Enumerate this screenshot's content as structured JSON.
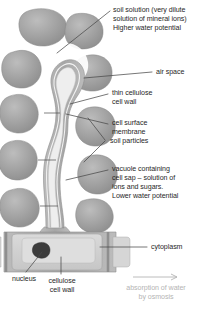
{
  "diagram": {
    "labels": {
      "soil_solution": "soil solution (very dilute\nsolution of mineral ions)\nHigher water potential",
      "air_space": "air space",
      "thin_cellulose_cell_wall": "thin cellulose\ncell wall",
      "cell_surface_membrane": "cell surface\nmembrane",
      "soil_particles": "soil particles",
      "vacuole": "vacuole containing\ncell sap – solution of\nions and sugars.\nLower water potential",
      "cytoplasm": "cytoplasm",
      "nucleus": "nucleus",
      "cellulose_cell_wall": "cellulose\ncell wall",
      "absorption_arrow_caption": "absorption of water\nby osmosis"
    },
    "colors": {
      "soil_particle": "#9b9b9b",
      "soil_particle_edge": "#8a8a8a",
      "halo": "#ffffff",
      "cell_wall": "#adadad",
      "cytoplasm": "#d2d2d2",
      "vacuole": "#dcdcdc",
      "nucleus": "#3c3c3c",
      "hair_lumen": "#f2f2f2",
      "leader_line": "#4a4a4a",
      "text": "#272727",
      "faint_text": "#b4b4b4",
      "background": "#ffffff"
    }
  }
}
